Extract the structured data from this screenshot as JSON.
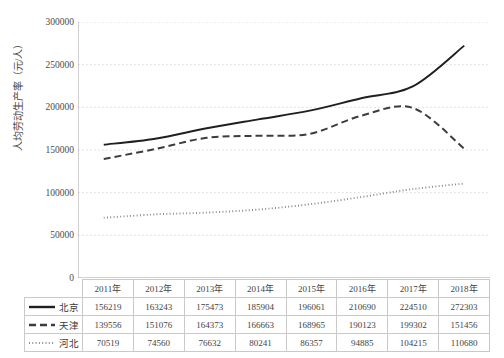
{
  "chart_data": {
    "type": "line",
    "title": "",
    "xlabel": "",
    "ylabel": "人均劳动生产率（元/人）",
    "categories": [
      "2011年",
      "2012年",
      "2013年",
      "2014年",
      "2015年",
      "2016年",
      "2017年",
      "2018年"
    ],
    "ylim": [
      0,
      300000
    ],
    "y_ticks": [
      "0",
      "50000",
      "100000",
      "150000",
      "200000",
      "250000",
      "300000"
    ],
    "y_tick_values": [
      0,
      50000,
      100000,
      150000,
      200000,
      250000,
      300000
    ],
    "grid": true,
    "legend_position": "table-row-header",
    "series": [
      {
        "name": "北京",
        "style": "solid",
        "color": "#1f1f1f",
        "values": [
          156219,
          163243,
          175473,
          185904,
          196061,
          210690,
          224510,
          272303
        ]
      },
      {
        "name": "天津",
        "style": "dashed",
        "color": "#3c3c3c",
        "values": [
          139556,
          151076,
          164373,
          166663,
          168965,
          190123,
          199302,
          151456
        ]
      },
      {
        "name": "河北",
        "style": "dotted",
        "color": "#8c8c8c",
        "values": [
          70519,
          74560,
          76632,
          80241,
          86357,
          94885,
          104215,
          110680
        ]
      }
    ]
  },
  "table": {
    "corner_label": "",
    "column_headers": [
      "2011年",
      "2012年",
      "2013年",
      "2014年",
      "2015年",
      "2016年",
      "2017年",
      "2018年"
    ],
    "rows": [
      {
        "label": "北京",
        "swatch": "solid-line-icon",
        "cells": [
          "156219",
          "163243",
          "175473",
          "185904",
          "196061",
          "210690",
          "224510",
          "272303"
        ]
      },
      {
        "label": "天津",
        "swatch": "dashed-line-icon",
        "cells": [
          "139556",
          "151076",
          "164373",
          "166663",
          "168965",
          "190123",
          "199302",
          "151456"
        ]
      },
      {
        "label": "河北",
        "swatch": "dotted-line-icon",
        "cells": [
          "70519",
          "74560",
          "76632",
          "80241",
          "86357",
          "94885",
          "104215",
          "110680"
        ]
      }
    ]
  },
  "axis": {
    "y_title": "人均劳动生产率（元/人）",
    "y_tick_labels": [
      "300000",
      "250000",
      "200000",
      "150000",
      "100000",
      "50000",
      "0"
    ]
  },
  "colors": {
    "grid": "#cfcfcf",
    "axis": "#9a9a9a",
    "beijing": "#1f1f1f",
    "tianjin": "#3c3c3c",
    "hebei": "#8c8c8c",
    "table_border": "#c9c9c9"
  }
}
